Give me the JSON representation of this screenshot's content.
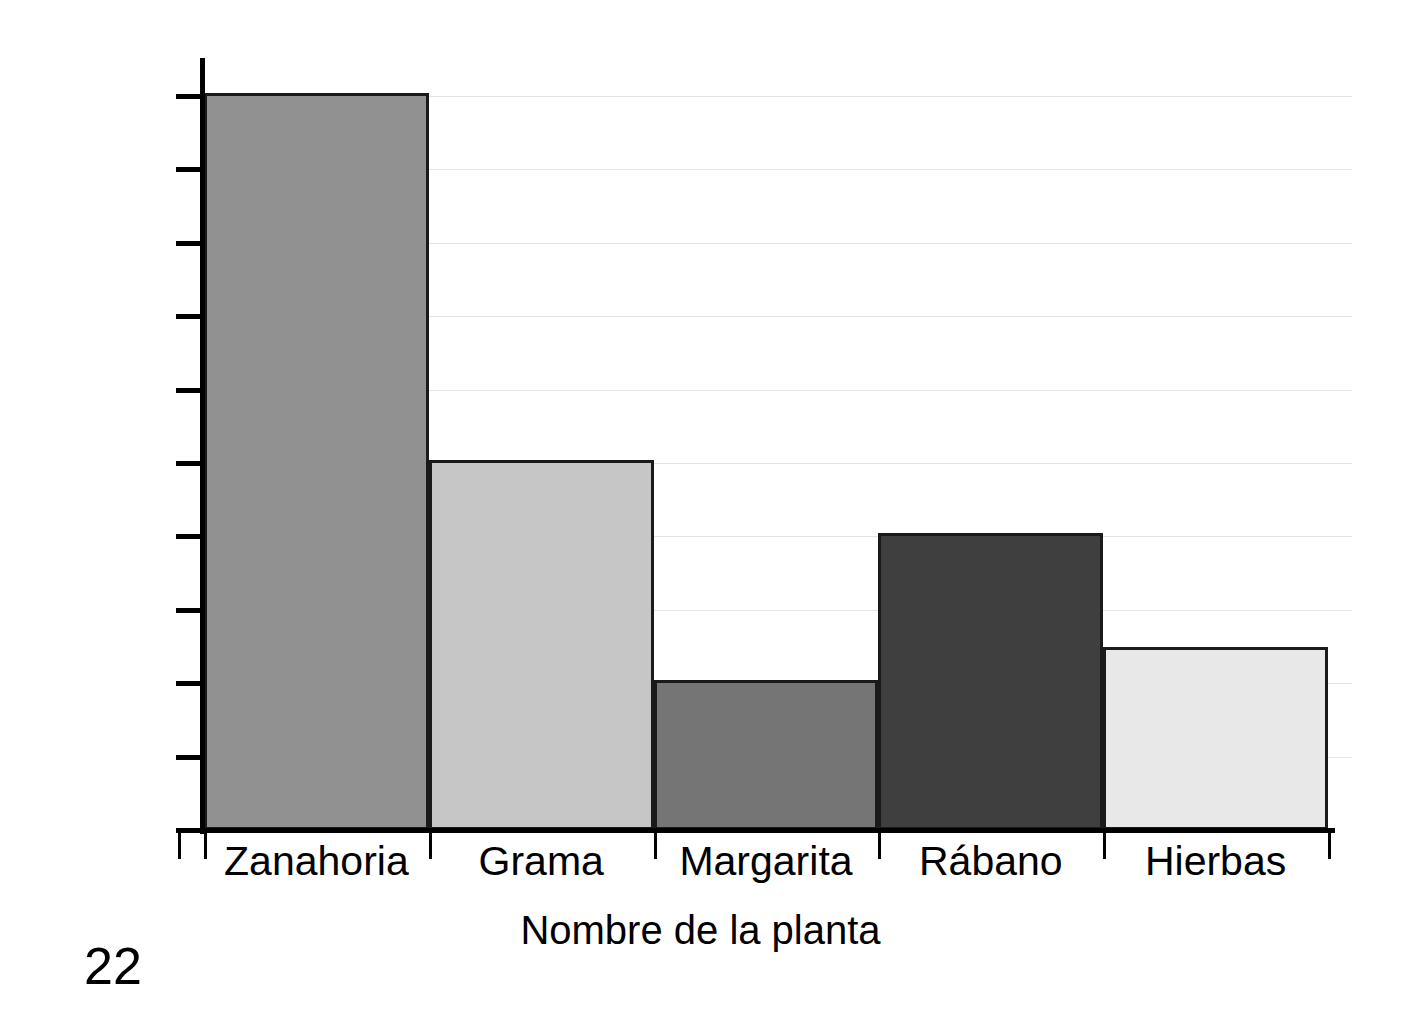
{
  "page": {
    "number": "22"
  },
  "chart_data": {
    "type": "bar",
    "title": "",
    "xlabel": "Nombre de la planta",
    "ylabel": "Longitud de la raíz (pulg)",
    "categories": [
      "Zanahoria",
      "Grama",
      "Margarita",
      "Rábano",
      "Hierbas"
    ],
    "values": [
      10,
      5,
      2,
      4,
      2.45
    ],
    "ylim": [
      0,
      10.5
    ],
    "ytick_values": [
      0,
      1,
      2,
      3,
      4,
      5,
      6,
      7,
      8,
      9,
      10
    ],
    "ytick_labels": [
      "",
      "",
      "",
      "",
      "",
      "",
      "",
      "",
      "",
      "",
      ""
    ],
    "grid": true,
    "grid_color": "#e4e4e4",
    "legend": "none",
    "axis_color": "#000000",
    "bar_colors": [
      "#919191",
      "#c6c6c6",
      "#757575",
      "#3f3f3f",
      "#e8e8e8"
    ],
    "bar_edge_color": "#1a1a1a",
    "bar_gap": 0,
    "series": [
      {
        "name": "Longitud de la raíz",
        "values": [
          10,
          5,
          2,
          4,
          2.45
        ]
      }
    ]
  }
}
